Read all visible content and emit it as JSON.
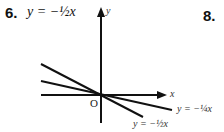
{
  "problem": {
    "number": "6.",
    "equation": "y = −½x"
  },
  "next_problem": {
    "number": "8."
  },
  "graph": {
    "x_axis_label": "x",
    "y_axis_label": "y",
    "origin_label": "O",
    "lines": [
      {
        "label": "y = −¼x",
        "slope": -0.25
      },
      {
        "label": "y = −½x",
        "slope": -0.5
      }
    ]
  }
}
